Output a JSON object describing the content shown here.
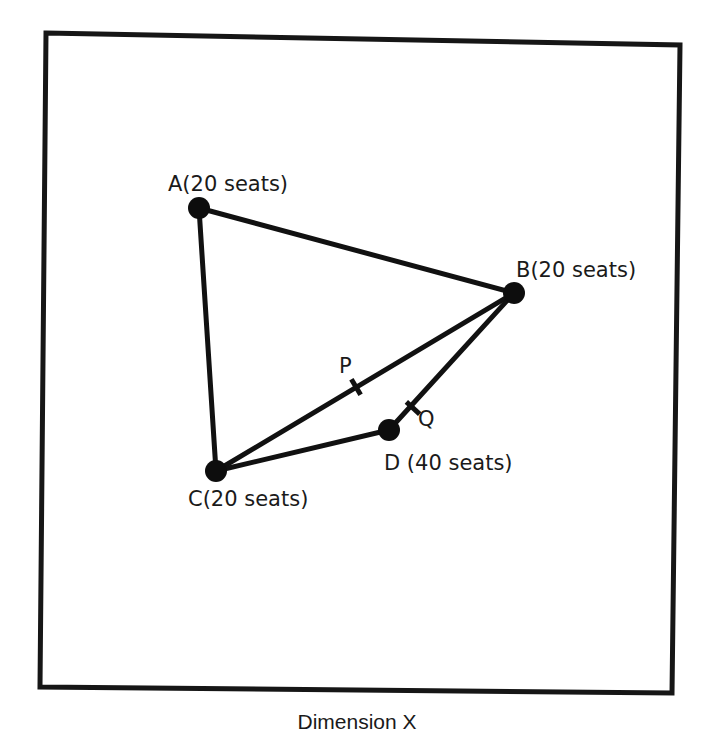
{
  "diagram": {
    "type": "seat-location perceptual map",
    "axis_label_x": "Dimension X",
    "frame": {
      "top_left": [
        46,
        33
      ],
      "top_right": [
        680,
        45
      ],
      "bottom_right": [
        672,
        693
      ],
      "bottom_left": [
        40,
        687
      ]
    },
    "points": [
      {
        "id": "A",
        "label": "A(20 seats)",
        "seats": 20,
        "x": 199,
        "y": 208,
        "label_x": 168,
        "label_y": 191
      },
      {
        "id": "B",
        "label": "B(20 seats)",
        "seats": 20,
        "x": 514,
        "y": 293,
        "label_x": 516,
        "label_y": 277
      },
      {
        "id": "C",
        "label": "C(20 seats)",
        "seats": 20,
        "x": 216,
        "y": 471,
        "label_x": 188,
        "label_y": 506
      },
      {
        "id": "D",
        "label": "D (40 seats)",
        "seats": 40,
        "x": 389,
        "y": 430,
        "label_x": 384,
        "label_y": 470
      }
    ],
    "edges": [
      {
        "from": "A",
        "to": "B"
      },
      {
        "from": "A",
        "to": "C"
      },
      {
        "from": "B",
        "to": "C"
      },
      {
        "from": "C",
        "to": "D"
      },
      {
        "from": "D",
        "to": "B"
      }
    ],
    "marks": [
      {
        "id": "P",
        "label": "P",
        "on_edge": "B-C",
        "x": 356,
        "y": 387,
        "label_x": 339,
        "label_y": 373
      },
      {
        "id": "Q",
        "label": "Q",
        "on_edge": "D-B",
        "x": 413,
        "y": 408,
        "label_x": 418,
        "label_y": 426
      }
    ],
    "colors": {
      "ink": "#111111",
      "background": "#ffffff"
    }
  }
}
